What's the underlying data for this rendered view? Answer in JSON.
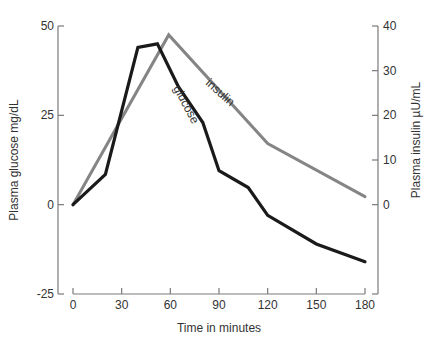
{
  "chart_data": {
    "type": "line",
    "title": "",
    "xlabel": "Time in minutes",
    "ylabel_left": "Plasma glucose mg/dL",
    "ylabel_right": "Plasma insulin µU/mL",
    "x_ticks": [
      0,
      30,
      60,
      90,
      120,
      150,
      180
    ],
    "xlim": [
      0,
      180
    ],
    "y_left_ticks": [
      -25,
      0,
      25,
      50
    ],
    "y_left_lim": [
      -25,
      50
    ],
    "y_right_ticks": [
      0,
      10,
      20,
      30,
      40
    ],
    "y_right_lim": [
      -20,
      40
    ],
    "grid": false,
    "legend": "inline labels on lines",
    "series": [
      {
        "name": "glucose",
        "axis": "left",
        "color": "#1a1a1a",
        "x": [
          0,
          20,
          40,
          52,
          65,
          80,
          90,
          108,
          120,
          150,
          180
        ],
        "values": [
          0,
          8.5,
          44,
          45,
          33,
          23,
          9.5,
          4.8,
          -3,
          -11,
          -16
        ]
      },
      {
        "name": "insulin",
        "axis": "right",
        "color": "#858585",
        "x": [
          0,
          59,
          120,
          180
        ],
        "values": [
          0,
          38,
          13.7,
          1.8
        ]
      }
    ],
    "annotations": [
      {
        "text": "glucose",
        "near_series": "glucose"
      },
      {
        "text": "insulin",
        "near_series": "insulin"
      }
    ]
  },
  "colors": {
    "axis": "#7a7a7a",
    "text": "#333333",
    "background": "#ffffff"
  }
}
